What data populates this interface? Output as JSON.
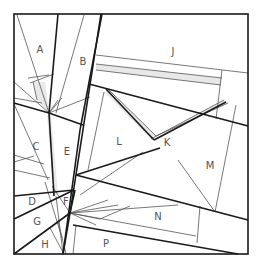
{
  "diagram": {
    "title": "",
    "type": "paper-piecing pattern",
    "frame": {
      "x": 14,
      "y": 14,
      "width": 234,
      "height": 240
    },
    "colors": {
      "line": "#1a1a1a",
      "thin_line": "#555555",
      "shade": "#e6e6e6",
      "label": "#555555"
    },
    "labels": [
      {
        "text": "A",
        "x": 40,
        "y": 50
      },
      {
        "text": "B",
        "x": 83,
        "y": 62
      },
      {
        "text": "J",
        "x": 173,
        "y": 52
      },
      {
        "text": "L",
        "x": 119,
        "y": 142
      },
      {
        "text": "K",
        "x": 167,
        "y": 143
      },
      {
        "text": "C",
        "x": 36,
        "y": 147
      },
      {
        "text": "E",
        "x": 67,
        "y": 152
      },
      {
        "text": "M",
        "x": 210,
        "y": 166
      },
      {
        "text": "D",
        "x": 32,
        "y": 202
      },
      {
        "text": "F",
        "x": 66,
        "y": 202
      },
      {
        "text": "G",
        "x": 37,
        "y": 222
      },
      {
        "text": "N",
        "x": 158,
        "y": 217
      },
      {
        "text": "H",
        "x": 45,
        "y": 245
      },
      {
        "text": "P",
        "x": 106,
        "y": 244
      }
    ]
  }
}
